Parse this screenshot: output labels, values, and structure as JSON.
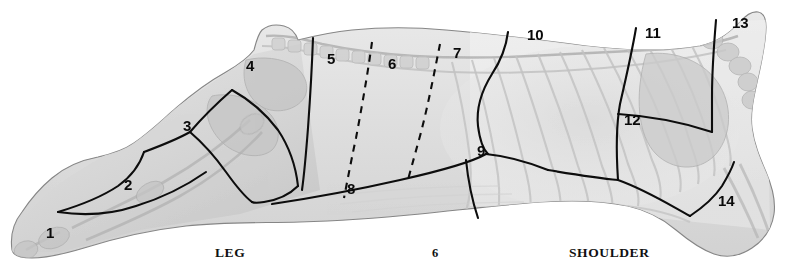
{
  "figure": {
    "kind": "meat-carcass-cutting-diagram",
    "orientation": "side view, head to the right",
    "page_number": "6",
    "colors": {
      "background": "#ffffff",
      "carcass_fill_light": "#e8e8e8",
      "carcass_fill_mid": "#dcdcdc",
      "carcass_fill_dark": "#c9c9c9",
      "outline": "#7a7a7a",
      "cut_line": "#0d0d0d",
      "label_text": "#0a0a0a"
    }
  },
  "captions": [
    {
      "id": "leg",
      "label": "LEG"
    },
    {
      "id": "shoulder",
      "label": "SHOULDER"
    }
  ],
  "section_numbers": [
    {
      "id": "1",
      "label": "1",
      "x": 46,
      "y": 238
    },
    {
      "id": "2",
      "label": "2",
      "x": 124,
      "y": 190
    },
    {
      "id": "3",
      "label": "3",
      "x": 183,
      "y": 131
    },
    {
      "id": "4",
      "label": "4",
      "x": 246,
      "y": 71
    },
    {
      "id": "5",
      "label": "5",
      "x": 327,
      "y": 64
    },
    {
      "id": "6",
      "label": "6",
      "x": 388,
      "y": 69
    },
    {
      "id": "7",
      "label": "7",
      "x": 453,
      "y": 58
    },
    {
      "id": "8",
      "label": "8",
      "x": 347,
      "y": 194
    },
    {
      "id": "9",
      "label": "9",
      "x": 477,
      "y": 156
    },
    {
      "id": "10",
      "label": "10",
      "x": 527,
      "y": 40
    },
    {
      "id": "11",
      "label": "11",
      "x": 645,
      "y": 38
    },
    {
      "id": "12",
      "label": "12",
      "x": 624,
      "y": 125
    },
    {
      "id": "13",
      "label": "13",
      "x": 732,
      "y": 28
    },
    {
      "id": "14",
      "label": "14",
      "x": 718,
      "y": 206
    }
  ]
}
